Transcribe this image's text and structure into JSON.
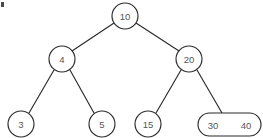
{
  "diagram": {
    "type": "binary-search-tree",
    "corner_mark": ".",
    "nodes": [
      {
        "id": "root",
        "label": "10",
        "shape": "circle",
        "cx": 125,
        "cy": 16,
        "r": 13
      },
      {
        "id": "n4",
        "label": "4",
        "shape": "circle",
        "cx": 62,
        "cy": 59,
        "r": 13
      },
      {
        "id": "n20",
        "label": "20",
        "shape": "circle",
        "cx": 189,
        "cy": 59,
        "r": 13
      },
      {
        "id": "n3",
        "label": "3",
        "shape": "circle",
        "cx": 21,
        "cy": 124,
        "r": 13
      },
      {
        "id": "n5",
        "label": "5",
        "shape": "circle",
        "cx": 102,
        "cy": 124,
        "r": 13
      },
      {
        "id": "n15",
        "label": "15",
        "shape": "circle",
        "cx": 148,
        "cy": 124,
        "r": 13
      }
    ],
    "pill_node": {
      "id": "n3040",
      "left_label": "30",
      "right_label": "40",
      "x": 198,
      "y": 113,
      "width": 63,
      "height": 23,
      "radius": 11.5,
      "left_text_x": 213,
      "right_text_x": 246,
      "text_y": 125
    },
    "edges": [
      {
        "id": "root-to-4",
        "from": "root",
        "to": "n4",
        "x1": 114,
        "y1": 23,
        "x2": 72,
        "y2": 51
      },
      {
        "id": "root-to-20",
        "from": "root",
        "to": "n20",
        "x1": 136,
        "y1": 23,
        "x2": 179,
        "y2": 51
      },
      {
        "id": "n4-to-3",
        "from": "n4",
        "to": "n3",
        "x1": 54,
        "y1": 70,
        "x2": 29,
        "y2": 113
      },
      {
        "id": "n4-to-5",
        "from": "n4",
        "to": "n5",
        "x1": 70,
        "y1": 70,
        "x2": 94,
        "y2": 113
      },
      {
        "id": "n20-to-15",
        "from": "n20",
        "to": "n15",
        "x1": 181,
        "y1": 70,
        "x2": 156,
        "y2": 113
      },
      {
        "id": "n20-to-3040",
        "from": "n20",
        "to": "n3040",
        "x1": 197,
        "y1": 70,
        "x2": 222,
        "y2": 113
      }
    ],
    "colors": {
      "stroke": "#2b2b2b",
      "label": "#565656",
      "background": "#ffffff"
    }
  }
}
